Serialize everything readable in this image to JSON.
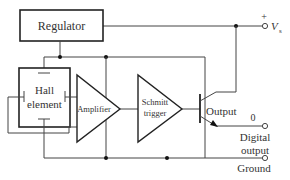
{
  "diagram": {
    "blocks": {
      "regulator": {
        "label": "Regulator"
      },
      "hall": {
        "label_line1": "Hall",
        "label_line2": "element"
      },
      "amplifier": {
        "label": "Amplifier"
      },
      "schmitt": {
        "label_line1": "Schmitt",
        "label_line2": "trigger"
      },
      "output": {
        "label": "Output"
      }
    },
    "terminals": {
      "vs": {
        "polarity": "+",
        "label": "V",
        "subscript": "s"
      },
      "digital_output": {
        "level": "0",
        "label_line1": "Digital",
        "label_line2": "output"
      },
      "ground": {
        "label": "Ground"
      }
    },
    "colors": {
      "line": "#444444",
      "box_border": "#222222",
      "text": "#333333",
      "background": "#ffffff"
    }
  }
}
